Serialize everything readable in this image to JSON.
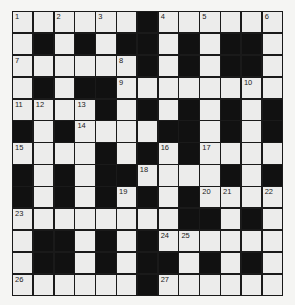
{
  "puzzle": {
    "type": "crossword",
    "rows": 13,
    "cols": 13,
    "colors": {
      "white_cell": "#ececeb",
      "black_cell": "#111111",
      "background": "#f5f5f3"
    },
    "layout": [
      "WWWWWWBWWWWWW",
      "WBWBWBBWBWBBW",
      "WWWWWWBWBWBBW",
      "WBWBBWWWWWWWW",
      "WWWWBWBWBWBWB",
      "BWBWWWWBBWBWB",
      "WWWWBWBWBWWWW",
      "BWBWBBWWWWBWB",
      "BWBWBWBWBWWWW",
      "WWWWWWWWBBWBW",
      "WBBWBWBWWWWWW",
      "WBBWBWBBWBWBW",
      "WWWWWWBWWWWWW"
    ],
    "numbers": [
      {
        "r": 0,
        "c": 0,
        "n": "1"
      },
      {
        "r": 0,
        "c": 2,
        "n": "2"
      },
      {
        "r": 0,
        "c": 4,
        "n": "3"
      },
      {
        "r": 0,
        "c": 7,
        "n": "4"
      },
      {
        "r": 0,
        "c": 9,
        "n": "5"
      },
      {
        "r": 0,
        "c": 12,
        "n": "6"
      },
      {
        "r": 2,
        "c": 0,
        "n": "7"
      },
      {
        "r": 2,
        "c": 5,
        "n": "8"
      },
      {
        "r": 3,
        "c": 5,
        "n": "9"
      },
      {
        "r": 3,
        "c": 11,
        "n": "10"
      },
      {
        "r": 4,
        "c": 0,
        "n": "11"
      },
      {
        "r": 4,
        "c": 1,
        "n": "12"
      },
      {
        "r": 4,
        "c": 3,
        "n": "13"
      },
      {
        "r": 5,
        "c": 3,
        "n": "14"
      },
      {
        "r": 6,
        "c": 0,
        "n": "15"
      },
      {
        "r": 6,
        "c": 7,
        "n": "16"
      },
      {
        "r": 6,
        "c": 9,
        "n": "17"
      },
      {
        "r": 7,
        "c": 6,
        "n": "18"
      },
      {
        "r": 8,
        "c": 5,
        "n": "19"
      },
      {
        "r": 8,
        "c": 9,
        "n": "20"
      },
      {
        "r": 8,
        "c": 10,
        "n": "21"
      },
      {
        "r": 8,
        "c": 12,
        "n": "22"
      },
      {
        "r": 9,
        "c": 0,
        "n": "23"
      },
      {
        "r": 10,
        "c": 7,
        "n": "24"
      },
      {
        "r": 10,
        "c": 8,
        "n": "25"
      },
      {
        "r": 12,
        "c": 0,
        "n": "26"
      },
      {
        "r": 12,
        "c": 7,
        "n": "27"
      }
    ]
  }
}
